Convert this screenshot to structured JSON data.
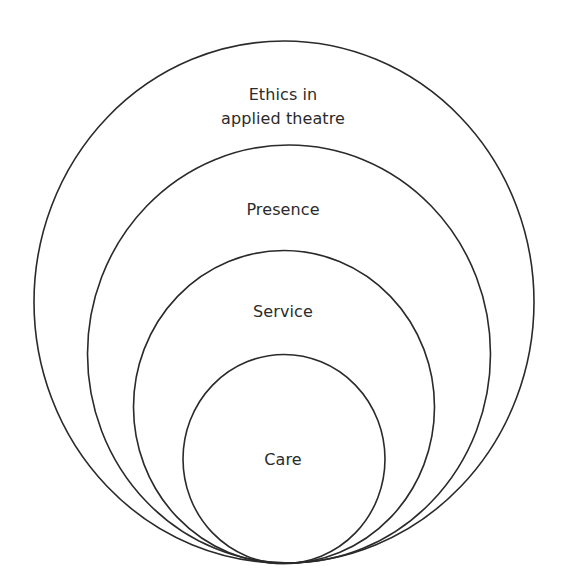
{
  "diagram": {
    "type": "nested-circles",
    "stroke_color": "#2a2a2a",
    "text_color": "#2b2b2b",
    "background": "#ffffff",
    "rings": [
      {
        "id": "ethics",
        "label_lines": [
          "Ethics in",
          "applied theatre"
        ],
        "cx": 284,
        "cy": 302,
        "rx": 250,
        "ry": 261
      },
      {
        "id": "presence",
        "label_lines": [
          "Presence"
        ],
        "cx": 289,
        "cy": 354,
        "rx": 201.5,
        "ry": 209
      },
      {
        "id": "service",
        "label_lines": [
          "Service"
        ],
        "cx": 284,
        "cy": 407,
        "rx": 150.5,
        "ry": 156.5
      },
      {
        "id": "care",
        "label_lines": [
          "Care"
        ],
        "cx": 284,
        "cy": 459,
        "rx": 101,
        "ry": 104.5
      }
    ]
  }
}
